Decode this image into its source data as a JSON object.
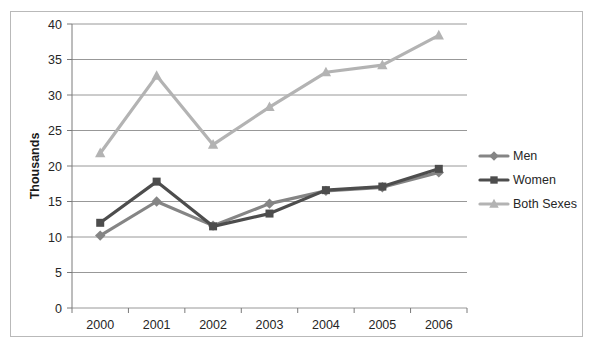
{
  "chart_data": {
    "type": "line",
    "title": "",
    "subtitle": "",
    "xlabel": "",
    "ylabel": "Thousands",
    "categories": [
      "2000",
      "2001",
      "2002",
      "2003",
      "2004",
      "2005",
      "2006"
    ],
    "ylim": [
      0,
      40
    ],
    "ytick_step": 5,
    "yticks": [
      "0",
      "5",
      "10",
      "15",
      "20",
      "25",
      "30",
      "35",
      "40"
    ],
    "grid": true,
    "grid_axis": "y",
    "legend_position": "right",
    "series": [
      {
        "name": "Men",
        "color": "#858585",
        "marker": "diamond",
        "values": [
          10.2,
          15.0,
          11.6,
          14.7,
          16.5,
          17.0,
          19.1
        ]
      },
      {
        "name": "Women",
        "color": "#4d4d4d",
        "marker": "square",
        "values": [
          12.0,
          17.8,
          11.5,
          13.3,
          16.6,
          17.1,
          19.6
        ]
      },
      {
        "name": "Both Sexes",
        "color": "#b3b3b3",
        "marker": "triangle",
        "values": [
          21.8,
          32.7,
          23.0,
          28.3,
          33.2,
          34.2,
          38.4
        ]
      }
    ]
  },
  "legend": {
    "items": [
      {
        "label": "Men"
      },
      {
        "label": "Women"
      },
      {
        "label": "Both Sexes"
      }
    ]
  },
  "axes": {
    "y_title": "Thousands"
  },
  "colors": {
    "men": "#858585",
    "women": "#4d4d4d",
    "both": "#b3b3b3",
    "gridline": "#8c8c8c",
    "border": "#b9b9b9",
    "text": "#262626"
  }
}
